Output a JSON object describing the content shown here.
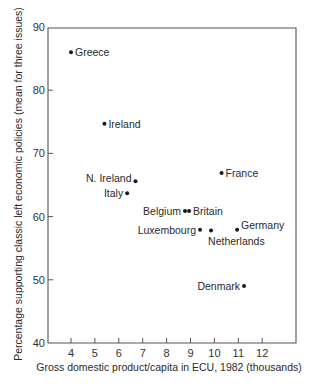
{
  "chart_data": {
    "type": "scatter",
    "title": "",
    "xlabel": "Gross domestic product/capita in ECU, 1982 (thousands)",
    "ylabel": "Percentage supporting classic left economic policies (mean for three issues)",
    "xlim": [
      3,
      13.3
    ],
    "ylim": [
      40,
      90
    ],
    "xticks": [
      4,
      5,
      6,
      7,
      8,
      9,
      10,
      11,
      12
    ],
    "yticks": [
      40,
      50,
      60,
      70,
      80,
      90
    ],
    "grid": false,
    "legend": null,
    "points": [
      {
        "label": "Greece",
        "x": 4.0,
        "y": 86.0,
        "label_pos": "right"
      },
      {
        "label": "Ireland",
        "x": 5.4,
        "y": 74.7,
        "label_pos": "right"
      },
      {
        "label": "N. Ireland",
        "x": 6.7,
        "y": 65.6,
        "label_pos": "left-up"
      },
      {
        "label": "Italy",
        "x": 6.35,
        "y": 63.7,
        "label_pos": "left"
      },
      {
        "label": "France",
        "x": 10.3,
        "y": 66.9,
        "label_pos": "right"
      },
      {
        "label": "Belgium",
        "x": 8.77,
        "y": 60.9,
        "label_pos": "left"
      },
      {
        "label": "Britain",
        "x": 8.94,
        "y": 60.9,
        "label_pos": "right"
      },
      {
        "label": "Luxembourg",
        "x": 9.4,
        "y": 57.9,
        "label_pos": "left"
      },
      {
        "label": "Netherlands",
        "x": 9.86,
        "y": 57.8,
        "label_pos": "below"
      },
      {
        "label": "Germany",
        "x": 10.95,
        "y": 57.9,
        "label_pos": "right-up"
      },
      {
        "label": "Denmark",
        "x": 11.24,
        "y": 49.0,
        "label_pos": "left"
      }
    ]
  }
}
